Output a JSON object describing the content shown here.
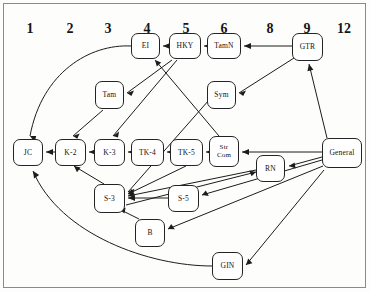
{
  "figure": {
    "type": "diagram",
    "kind": "directed-graph"
  },
  "columns": {
    "label_row_y": 22,
    "items": [
      {
        "label": "1",
        "x": 30
      },
      {
        "label": "2",
        "x": 70
      },
      {
        "label": "3",
        "x": 108
      },
      {
        "label": "4",
        "x": 147
      },
      {
        "label": "5",
        "x": 186
      },
      {
        "label": "6",
        "x": 224
      },
      {
        "label": "8",
        "x": 270
      },
      {
        "label": "9",
        "x": 307
      },
      {
        "label": "12",
        "x": 344
      }
    ]
  },
  "nodes": [
    {
      "id": "JC",
      "label": "JC",
      "x": 13,
      "y": 139,
      "w": 30,
      "h": 27,
      "lines": 1
    },
    {
      "id": "K2",
      "label": "K-2",
      "x": 55,
      "y": 139,
      "w": 31,
      "h": 27,
      "lines": 1
    },
    {
      "id": "K3",
      "label": "K-3",
      "x": 94,
      "y": 139,
      "w": 31,
      "h": 27,
      "lines": 1
    },
    {
      "id": "TK4",
      "label": "TK-4",
      "x": 131,
      "y": 139,
      "w": 33,
      "h": 27,
      "lines": 1
    },
    {
      "id": "TK5",
      "label": "TK-5",
      "x": 170,
      "y": 139,
      "w": 33,
      "h": 27,
      "lines": 1
    },
    {
      "id": "StrCom",
      "label": "Str\nCom",
      "x": 209,
      "y": 136,
      "w": 30,
      "h": 31,
      "lines": 2
    },
    {
      "id": "Tam",
      "label": "Tam",
      "x": 95,
      "y": 81,
      "w": 29,
      "h": 28,
      "lines": 1
    },
    {
      "id": "Sym",
      "label": "Sym",
      "x": 207,
      "y": 81,
      "w": 29,
      "h": 28,
      "lines": 1
    },
    {
      "id": "EI",
      "label": "EI",
      "x": 131,
      "y": 33,
      "w": 29,
      "h": 26,
      "lines": 1
    },
    {
      "id": "HKY",
      "label": "HKY",
      "x": 169,
      "y": 33,
      "w": 32,
      "h": 26,
      "lines": 1
    },
    {
      "id": "TamN",
      "label": "TamN",
      "x": 207,
      "y": 33,
      "w": 34,
      "h": 26,
      "lines": 1
    },
    {
      "id": "GTR",
      "label": "GTR",
      "x": 292,
      "y": 33,
      "w": 31,
      "h": 28,
      "lines": 1
    },
    {
      "id": "RN",
      "label": "RN",
      "x": 256,
      "y": 155,
      "w": 29,
      "h": 27,
      "lines": 1
    },
    {
      "id": "General",
      "label": "General",
      "x": 322,
      "y": 138,
      "w": 40,
      "h": 30,
      "lines": 1
    },
    {
      "id": "S3",
      "label": "S-3",
      "x": 94,
      "y": 184,
      "w": 31,
      "h": 29,
      "lines": 1
    },
    {
      "id": "S5",
      "label": "S-5",
      "x": 168,
      "y": 185,
      "w": 31,
      "h": 27,
      "lines": 1
    },
    {
      "id": "B",
      "label": "B",
      "x": 135,
      "y": 219,
      "w": 30,
      "h": 28,
      "lines": 1
    },
    {
      "id": "GIN",
      "label": "GIN",
      "x": 212,
      "y": 252,
      "w": 31,
      "h": 28,
      "lines": 1
    }
  ],
  "edges": [
    {
      "from": "K2",
      "to": "JC",
      "path": "M 55 152 L 46 152",
      "arrow": "M 46 152 l 7 -3 l 0 6 z"
    },
    {
      "from": "K3",
      "to": "K2",
      "path": "M 94 152 L 89 152",
      "arrow": "M 89 152 l 7 -3 l 0 6 z"
    },
    {
      "from": "TK4",
      "to": "K3",
      "path": "M 131 152 L 128 152",
      "arrow": "M 128 152 l 7 -3 l 0 6 z"
    },
    {
      "from": "TK5",
      "to": "TK4",
      "path": "M 170 152 L 167 152",
      "arrow": "M 167 152 l 7 -3 l 0 6 z"
    },
    {
      "from": "StrCom",
      "to": "TK5",
      "path": "M 209 152 L 206 152",
      "arrow": "M 206 152 l 7 -3 l 0 6 z"
    },
    {
      "from": "HKY",
      "to": "EI",
      "path": "M 169 46 L 163 46",
      "arrow": "M 163 46 l 7 -3 l 0 6 z"
    },
    {
      "from": "TamN",
      "to": "HKY",
      "path": "M 207 46 L 204 46",
      "arrow": "M 204 46 l 7 -3 l 0 6 z"
    },
    {
      "from": "GTR",
      "to": "TamN",
      "path": "M 292 46 L 244 46",
      "arrow": "M 244 46 l 7 -3 l 0 6 z"
    },
    {
      "from": "General",
      "to": "StrCom",
      "path": "M 322 152 L 242 152",
      "arrow": "M 242 152 l 7 -3 l 0 6 z"
    },
    {
      "from": "S5",
      "to": "S3",
      "path": "M 168 198 L 128 198",
      "arrow": "M 128 198 l 7 -3 l 0 6 z"
    },
    {
      "from": "GIN",
      "to": "JC",
      "path": "M 212 266 C 150 266 60 235 33 171",
      "arrow": "M 33 171 l 1 7.4 l 5.2 -3.4 z"
    },
    {
      "from": "EI",
      "to": "JC",
      "path": "M 131 46 C 90 44 42 72 30 136",
      "arrow": "M 30 136 l 4.6 6 l 1.6 -6 z"
    },
    {
      "from": "Tam",
      "to": "K2",
      "path": "M 103 110 L 73 136",
      "arrow": "M 73 136 l 6.6 -2.4 l -2.4 5.2 z"
    },
    {
      "from": "HKY",
      "to": "Tam",
      "path": "M 172 60 L 127 93",
      "arrow": "M 127 93 l 7 -2.6 l -2.6 5.6 z"
    },
    {
      "from": "HKY",
      "to": "K3",
      "path": "M 177 60 L 113 136",
      "arrow": "M 113 136 l 6 -4.4 l -1 6 z"
    },
    {
      "from": "GTR",
      "to": "Sym",
      "path": "M 294 58 L 239 93",
      "arrow": "M 239 93 l 7 -2.4 l -2.8 5.4 z"
    },
    {
      "from": "Sym",
      "to": "S3",
      "path": "M 209 100 L 128 192",
      "arrow": "M 128 192 l 6.4 -3.2 l -1.8 6 z"
    },
    {
      "from": "StrCom",
      "to": "EI",
      "path": "M 219 136 L 155 60",
      "arrow": "M 155 60 l 1.8 6.6 l 4.4 -4 z"
    },
    {
      "from": "General",
      "to": "GTR",
      "path": "M 327 138 L 309 64",
      "arrow": "M 309 64 l -1.6 7.2 l 6 -1.4 z"
    },
    {
      "from": "General",
      "to": "RN",
      "path": "M 322 157 L 289 166",
      "arrow": "M 289 166 l 6.6 2.6 l -1 -6 z"
    },
    {
      "from": "General",
      "to": "S5",
      "path": "M 322 160 L 202 195",
      "arrow": "M 202 195 l 6.8 1 l -3 -5.4 z"
    },
    {
      "from": "General",
      "to": "B",
      "path": "M 323 166 L 168 229",
      "arrow": "M 168 229 l 6.8 0.2 l -3.6 -5.2 z"
    },
    {
      "from": "General",
      "to": "GIN",
      "path": "M 324 170 L 246 265",
      "arrow": "M 246 265 l 6.4 -1.8 l -4.2 -4.8 z"
    },
    {
      "from": "RN",
      "to": "S3",
      "path": "M 256 170 L 128 196",
      "arrow": "M 128 196 l 6.8 1.2 l -2.6 -5.6 z"
    },
    {
      "from": "TK5",
      "to": "S3",
      "path": "M 186 166 L 128 194",
      "arrow": "M 128 194 l 6.8 0.4 l -3.2 -5.4 z"
    },
    {
      "from": "S3",
      "to": "K2",
      "path": "M 104 184 L 74 166",
      "arrow": "M 74 166 l 3 6.2 l 3.6 -4.6 z"
    },
    {
      "from": "B",
      "to": "S3",
      "path": "M 139 219 L 119 209",
      "arrow": "M 119 209 l 5.4 4.4 l 1.2 -5.6 z"
    },
    {
      "from": "S3",
      "to": "RN",
      "path": "M 126 205 L 256 172",
      "arrow": "M 256 172 l -6.8 -1.6 l 2.4 5.8 z"
    }
  ]
}
